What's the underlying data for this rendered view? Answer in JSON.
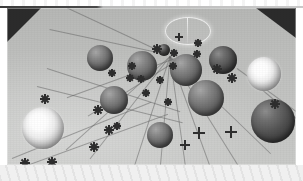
{
  "scene": {
    "title": "Rendered 3D sphere scene",
    "description": "Grayscale ray-traced image: spheres of varying size and shading resting on a flat gray plane, with small dark star-shaped markers linked by thin radiating guide lines, two glowing white spheres, and dark triangular backdrop corners at the top.",
    "background_color": "#bfc0bf",
    "plane_color": "#c3c4c2",
    "corner_color": "#2b2b2b",
    "marker_color": "#2e2e2e",
    "ray_color": "#5c5c5c",
    "border_color": "#ffffff"
  },
  "frame": {
    "x": 7,
    "y": 8,
    "width": 289,
    "height": 157
  },
  "corners": [
    {
      "name": "top-left-backdrop",
      "position": "top-left",
      "size": 34
    },
    {
      "name": "top-right-backdrop",
      "position": "top-right",
      "width": 40,
      "height": 30
    }
  ],
  "halo": {
    "name": "light-source-halo",
    "x": 158,
    "y": 9,
    "width": 44,
    "height": 26,
    "line_x": 180,
    "line_y": 10,
    "line_height": 30,
    "color": "#ffffff"
  },
  "spheres": [
    {
      "id": "s01",
      "label": "sphere-upper-left-mid",
      "shade": "mid",
      "cx": 93,
      "cy": 50,
      "r": 13
    },
    {
      "id": "s02",
      "label": "sphere-upper-centerleft",
      "shade": "mid",
      "cx": 135,
      "cy": 58,
      "r": 15
    },
    {
      "id": "s03",
      "label": "sphere-top-tiny",
      "shade": "dark",
      "cx": 157,
      "cy": 42,
      "r": 6
    },
    {
      "id": "s04",
      "label": "sphere-center-top",
      "shade": "mid",
      "cx": 179,
      "cy": 62,
      "r": 16
    },
    {
      "id": "s05",
      "label": "sphere-upper-right-mid",
      "shade": "dark",
      "cx": 216,
      "cy": 52,
      "r": 14
    },
    {
      "id": "s06",
      "label": "sphere-right-glow",
      "shade": "bright",
      "cx": 257,
      "cy": 66,
      "r": 17
    },
    {
      "id": "s07",
      "label": "sphere-mid-left",
      "shade": "mid",
      "cx": 107,
      "cy": 92,
      "r": 14
    },
    {
      "id": "s08",
      "label": "sphere-mid-right",
      "shade": "mid",
      "cx": 199,
      "cy": 90,
      "r": 18
    },
    {
      "id": "s09",
      "label": "sphere-left-glow",
      "shade": "bright",
      "cx": 36,
      "cy": 120,
      "r": 21
    },
    {
      "id": "s10",
      "label": "sphere-lower-right-dark",
      "shade": "dark",
      "cx": 266,
      "cy": 113,
      "r": 22
    },
    {
      "id": "s11",
      "label": "sphere-lower-center",
      "shade": "mid",
      "cx": 153,
      "cy": 127,
      "r": 13
    }
  ],
  "markers": [
    {
      "id": "m01",
      "x": 150,
      "y": 41,
      "size": 5,
      "style": "star"
    },
    {
      "id": "m02",
      "x": 172,
      "y": 29,
      "size": 4,
      "style": "plus"
    },
    {
      "id": "m03",
      "x": 167,
      "y": 45,
      "size": 4,
      "style": "star"
    },
    {
      "id": "m04",
      "x": 191,
      "y": 35,
      "size": 4,
      "style": "star"
    },
    {
      "id": "m05",
      "x": 190,
      "y": 46,
      "size": 4,
      "style": "star"
    },
    {
      "id": "m06",
      "x": 166,
      "y": 58,
      "size": 4,
      "style": "star"
    },
    {
      "id": "m07",
      "x": 125,
      "y": 58,
      "size": 4,
      "style": "star"
    },
    {
      "id": "m08",
      "x": 123,
      "y": 70,
      "size": 4,
      "style": "star"
    },
    {
      "id": "m09",
      "x": 134,
      "y": 71,
      "size": 4,
      "style": "star"
    },
    {
      "id": "m10",
      "x": 153,
      "y": 72,
      "size": 4,
      "style": "star"
    },
    {
      "id": "m11",
      "x": 210,
      "y": 61,
      "size": 5,
      "style": "star"
    },
    {
      "id": "m12",
      "x": 225,
      "y": 70,
      "size": 5,
      "style": "star"
    },
    {
      "id": "m13",
      "x": 105,
      "y": 65,
      "size": 4,
      "style": "star"
    },
    {
      "id": "m14",
      "x": 139,
      "y": 85,
      "size": 4,
      "style": "star"
    },
    {
      "id": "m15",
      "x": 161,
      "y": 94,
      "size": 4,
      "style": "star"
    },
    {
      "id": "m16",
      "x": 268,
      "y": 96,
      "size": 5,
      "style": "star"
    },
    {
      "id": "m17",
      "x": 38,
      "y": 91,
      "size": 5,
      "style": "star"
    },
    {
      "id": "m18",
      "x": 91,
      "y": 102,
      "size": 5,
      "style": "star"
    },
    {
      "id": "m19",
      "x": 102,
      "y": 122,
      "size": 5,
      "style": "star"
    },
    {
      "id": "m20",
      "x": 87,
      "y": 139,
      "size": 5,
      "style": "star"
    },
    {
      "id": "m21",
      "x": 18,
      "y": 155,
      "size": 5,
      "style": "star"
    },
    {
      "id": "m22",
      "x": 45,
      "y": 154,
      "size": 5,
      "style": "star"
    },
    {
      "id": "m23",
      "x": 178,
      "y": 137,
      "size": 5,
      "style": "plus"
    },
    {
      "id": "m24",
      "x": 192,
      "y": 125,
      "size": 6,
      "style": "plus"
    },
    {
      "id": "m25",
      "x": 224,
      "y": 124,
      "size": 6,
      "style": "plus"
    },
    {
      "id": "m26",
      "x": 110,
      "y": 118,
      "size": 4,
      "style": "star"
    }
  ],
  "rays": [
    {
      "id": "r01",
      "x": 160,
      "y": 46,
      "length": 120,
      "angle": 192
    },
    {
      "id": "r02",
      "x": 160,
      "y": 46,
      "length": 110,
      "angle": 205
    },
    {
      "id": "r03",
      "x": 168,
      "y": 50,
      "length": 115,
      "angle": 160
    },
    {
      "id": "r04",
      "x": 170,
      "y": 52,
      "length": 105,
      "angle": 148
    },
    {
      "id": "r05",
      "x": 163,
      "y": 48,
      "length": 120,
      "angle": 108
    },
    {
      "id": "r06",
      "x": 163,
      "y": 48,
      "length": 120,
      "angle": 95
    },
    {
      "id": "r07",
      "x": 163,
      "y": 48,
      "length": 125,
      "angle": 82
    },
    {
      "id": "r08",
      "x": 163,
      "y": 48,
      "length": 125,
      "angle": 70
    },
    {
      "id": "r09",
      "x": 163,
      "y": 48,
      "length": 130,
      "angle": 58
    },
    {
      "id": "r10",
      "x": 163,
      "y": 48,
      "length": 140,
      "angle": 44
    },
    {
      "id": "r11",
      "x": 163,
      "y": 48,
      "length": 130,
      "angle": 128
    },
    {
      "id": "r12",
      "x": 163,
      "y": 48,
      "length": 140,
      "angle": 138
    },
    {
      "id": "r13",
      "x": 40,
      "y": 60,
      "length": 140,
      "angle": 18
    },
    {
      "id": "r14",
      "x": 30,
      "y": 78,
      "length": 150,
      "angle": 14
    },
    {
      "id": "r15",
      "x": 5,
      "y": 150,
      "length": 150,
      "angle": -22
    },
    {
      "id": "r16",
      "x": 20,
      "y": 157,
      "length": 150,
      "angle": -20
    },
    {
      "id": "r17",
      "x": 230,
      "y": 60,
      "length": 110,
      "angle": 36
    },
    {
      "id": "r18",
      "x": 244,
      "y": 72,
      "length": 100,
      "angle": 40
    }
  ]
}
